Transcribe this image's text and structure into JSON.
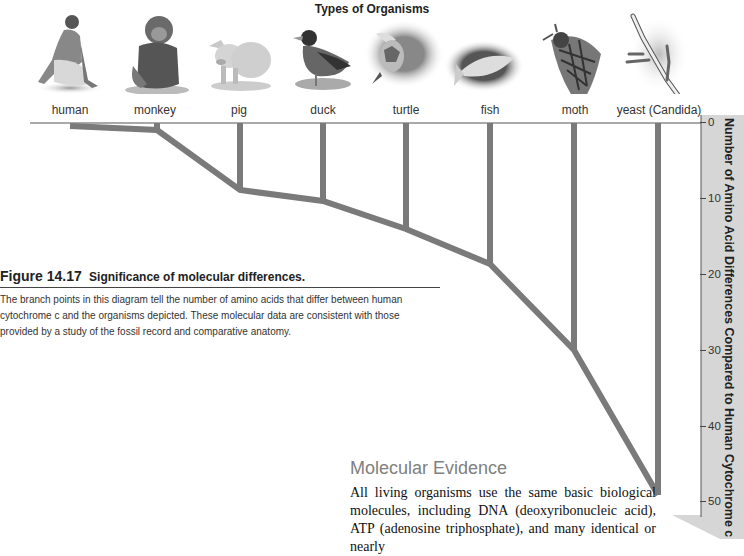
{
  "diagram": {
    "title": "Types of Organisms",
    "organisms": [
      {
        "name": "human",
        "icon": "human-illustration",
        "difference": 0
      },
      {
        "name": "monkey",
        "icon": "monkey-illustration",
        "difference": 1
      },
      {
        "name": "pig",
        "icon": "pig-illustration",
        "difference": 9
      },
      {
        "name": "duck",
        "icon": "duck-illustration",
        "difference": 10
      },
      {
        "name": "turtle",
        "icon": "turtle-illustration",
        "difference": 14
      },
      {
        "name": "fish",
        "icon": "fish-illustration",
        "difference": 18
      },
      {
        "name": "moth",
        "icon": "moth-illustration",
        "difference": 30
      },
      {
        "name": "yeast (Candida)",
        "icon": "yeast-illustration",
        "difference": 49
      }
    ],
    "axis": {
      "title": "Number of Amino Acid Differences Compared to Human Cytochrome c",
      "ticks": [
        "0",
        "10",
        "20",
        "30",
        "40",
        "50"
      ]
    },
    "colors": {
      "branch": "#7a7a7a",
      "band": "#d6d6d6"
    }
  },
  "caption": {
    "figure_label": "Figure 14.17",
    "figure_title": "Significance of molecular differences.",
    "body": "The branch points in this diagram tell the number of amino acids that differ between human cytochrome c and the organisms depicted. These molecular data are consistent with those provided by a study of the fossil record and comparative anatomy."
  },
  "section": {
    "title": "Molecular Evidence",
    "body": "All living organisms use the same basic biological molecules, including DNA (deoxyribonucleic acid), ATP (adenosine triphosphate), and many identical or nearly"
  }
}
